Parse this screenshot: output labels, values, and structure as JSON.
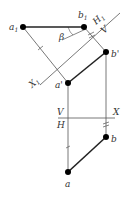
{
  "diagram": {
    "type": "descriptive-geometry-auxiliary-projection",
    "colors": {
      "line": "#555555",
      "segment": "#222222",
      "point": "#000000",
      "background": "#ffffff"
    },
    "points": {
      "a1": {
        "label": "a",
        "sub": "1"
      },
      "b1": {
        "label": "b",
        "sub": "1"
      },
      "b_prime": {
        "label": "b'"
      },
      "a_prime": {
        "label": "a'"
      },
      "b": {
        "label": "b"
      },
      "a": {
        "label": "a"
      }
    },
    "axes": {
      "main": {
        "upper": "V",
        "lower": "H",
        "name": "X"
      },
      "aux": {
        "h1_label": "H",
        "h1_sub": "1",
        "v_label": "V",
        "x1_label": "X",
        "x1_sub": "1"
      }
    },
    "angle_label": "β"
  }
}
